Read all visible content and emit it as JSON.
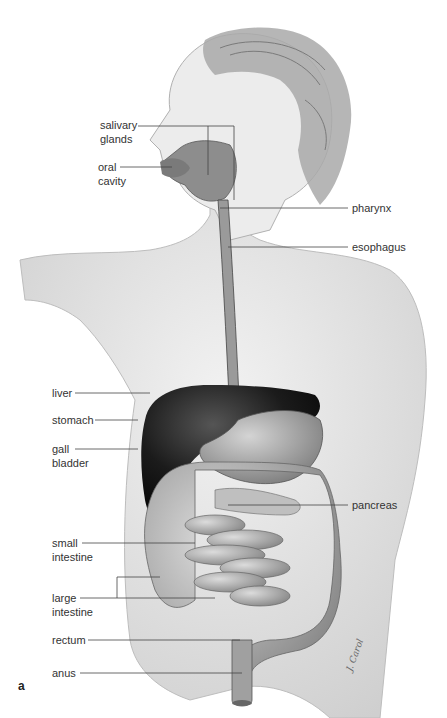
{
  "figure": {
    "panel_letter": "a",
    "artist_signature": "J. Carol",
    "labels": {
      "salivary_glands": [
        "salivary",
        "glands"
      ],
      "oral_cavity": [
        "oral",
        "cavity"
      ],
      "pharynx": "pharynx",
      "esophagus": "esophagus",
      "liver": "liver",
      "stomach": "stomach",
      "gall_bladder": [
        "gall",
        "bladder"
      ],
      "pancreas": "pancreas",
      "small_intestine": [
        "small",
        "intestine"
      ],
      "large_intestine": [
        "large",
        "intestine"
      ],
      "rectum": "rectum",
      "anus": "anus"
    },
    "colors": {
      "skin": "#ebebeb",
      "hair": "#a8a8a8",
      "liver": "#1e1e1e",
      "stomach": "#9a9a9a",
      "intestine": "#a6a6a6",
      "leader_line": "#444444"
    }
  }
}
